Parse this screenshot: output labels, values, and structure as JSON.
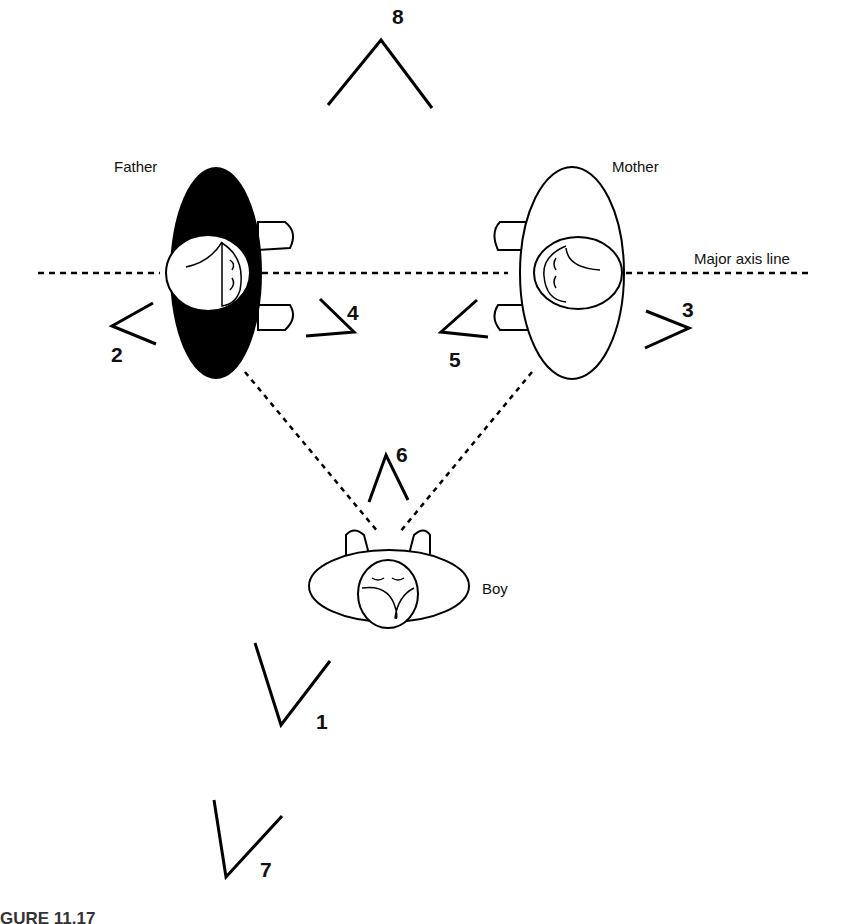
{
  "figure": {
    "caption": "GURE 11.17",
    "axis_label": "Major axis line",
    "people": [
      {
        "id": "father",
        "label": "Father",
        "fill": "#000000"
      },
      {
        "id": "mother",
        "label": "Mother",
        "fill": "#ffffff"
      },
      {
        "id": "boy",
        "label": "Boy",
        "fill": "#ffffff"
      }
    ],
    "camera_positions": [
      {
        "number": "1"
      },
      {
        "number": "2"
      },
      {
        "number": "3"
      },
      {
        "number": "4"
      },
      {
        "number": "5"
      },
      {
        "number": "6"
      },
      {
        "number": "7"
      },
      {
        "number": "8"
      }
    ]
  }
}
